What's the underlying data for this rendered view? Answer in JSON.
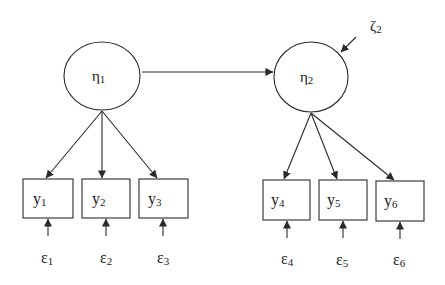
{
  "diagram": {
    "type": "structural-equation-model",
    "colors": {
      "stroke": "#2a2a2a",
      "text": "#1a1a1a",
      "background": "#ffffff"
    },
    "latent": [
      {
        "id": "eta1",
        "symbol": "η",
        "sub": "1",
        "cx": 102,
        "cy": 76,
        "rx": 38,
        "ry": 34
      },
      {
        "id": "eta2",
        "symbol": "η",
        "sub": "2",
        "cx": 311,
        "cy": 77,
        "rx": 37,
        "ry": 35
      }
    ],
    "disturbance": {
      "id": "zeta2",
      "symbol": "ζ",
      "sub": "2",
      "target": "eta2"
    },
    "observed": [
      {
        "id": "y1",
        "symbol": "y",
        "sub": "1",
        "x": 23,
        "y": 179,
        "w": 50,
        "h": 39
      },
      {
        "id": "y2",
        "symbol": "y",
        "sub": "2",
        "x": 82,
        "y": 179,
        "w": 48,
        "h": 39
      },
      {
        "id": "y3",
        "symbol": "y",
        "sub": "3",
        "x": 139,
        "y": 179,
        "w": 49,
        "h": 39
      },
      {
        "id": "y4",
        "symbol": "y",
        "sub": "4",
        "x": 263,
        "y": 180,
        "w": 47,
        "h": 40
      },
      {
        "id": "y5",
        "symbol": "y",
        "sub": "5",
        "x": 319,
        "y": 180,
        "w": 48,
        "h": 40
      },
      {
        "id": "y6",
        "symbol": "y",
        "sub": "6",
        "x": 376,
        "y": 181,
        "w": 48,
        "h": 40
      }
    ],
    "errors": [
      {
        "id": "e1",
        "symbol": "ε",
        "sub": "1",
        "target": "y1"
      },
      {
        "id": "e2",
        "symbol": "ε",
        "sub": "2",
        "target": "y2"
      },
      {
        "id": "e3",
        "symbol": "ε",
        "sub": "3",
        "target": "y3"
      },
      {
        "id": "e4",
        "symbol": "ε",
        "sub": "4",
        "target": "y4"
      },
      {
        "id": "e5",
        "symbol": "ε",
        "sub": "5",
        "target": "y5"
      },
      {
        "id": "e6",
        "symbol": "ε",
        "sub": "6",
        "target": "y6"
      }
    ],
    "paths": [
      {
        "from": "eta1",
        "to": "eta2"
      },
      {
        "from": "eta1",
        "to": "y1"
      },
      {
        "from": "eta1",
        "to": "y2"
      },
      {
        "from": "eta1",
        "to": "y3"
      },
      {
        "from": "eta2",
        "to": "y4"
      },
      {
        "from": "eta2",
        "to": "y5"
      },
      {
        "from": "eta2",
        "to": "y6"
      },
      {
        "from": "zeta2",
        "to": "eta2"
      },
      {
        "from": "e1",
        "to": "y1"
      },
      {
        "from": "e2",
        "to": "y2"
      },
      {
        "from": "e3",
        "to": "y3"
      },
      {
        "from": "e4",
        "to": "y4"
      },
      {
        "from": "e5",
        "to": "y5"
      },
      {
        "from": "e6",
        "to": "y6"
      }
    ]
  }
}
